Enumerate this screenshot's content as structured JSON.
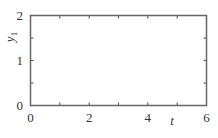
{
  "chart_data": {
    "type": "line",
    "title": "",
    "xlabel": "t",
    "ylabel": "y",
    "ylabel_subscript": "1",
    "xlim": [
      0,
      6
    ],
    "ylim": [
      0,
      2
    ],
    "x_ticks": [
      0,
      1,
      2,
      3,
      4,
      5,
      6
    ],
    "x_tick_labels": [
      "0",
      "2",
      "4",
      "6"
    ],
    "x_tick_label_values": [
      0,
      2,
      4,
      6
    ],
    "y_ticks": [
      0,
      0.5,
      1,
      1.5,
      2
    ],
    "y_tick_labels": [
      "0",
      "1",
      "2"
    ],
    "y_tick_label_values": [
      0,
      1,
      2
    ],
    "series": [],
    "grid": false,
    "legend": null
  },
  "colors": {
    "frame": "#666666",
    "text": "#333333"
  }
}
